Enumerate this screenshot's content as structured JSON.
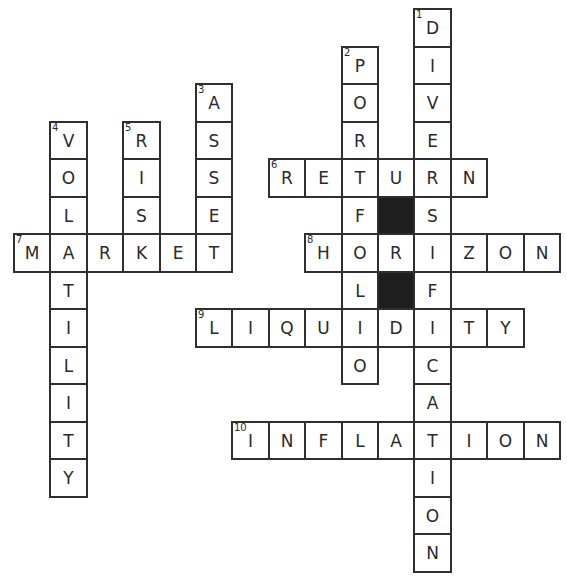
{
  "puzzle": {
    "grid": {
      "origin_x": 13,
      "origin_y": 8,
      "cell_w": 36.4,
      "cell_h": 37.5,
      "cols": 15,
      "rows": 15
    },
    "colors": {
      "border": "#2f2f2f",
      "block": "#1e1e1e",
      "text": "#2a2a2a",
      "background": "#ffffff"
    },
    "words": [
      {
        "number": 1,
        "direction": "down",
        "answer": "DIVERSIFICATION",
        "col": 11,
        "row": 0
      },
      {
        "number": 2,
        "direction": "down",
        "answer": "PORTFOLIO",
        "col": 9,
        "row": 1
      },
      {
        "number": 3,
        "direction": "down",
        "answer": "ASSET",
        "col": 5,
        "row": 2
      },
      {
        "number": 4,
        "direction": "down",
        "answer": "VOLATILITY",
        "col": 1,
        "row": 3
      },
      {
        "number": 5,
        "direction": "down",
        "answer": "RISK",
        "col": 3,
        "row": 3
      },
      {
        "number": 6,
        "direction": "across",
        "answer": "RETURN",
        "col": 7,
        "row": 4
      },
      {
        "number": 7,
        "direction": "across",
        "answer": "MARKET",
        "col": 0,
        "row": 6
      },
      {
        "number": 8,
        "direction": "across",
        "answer": "HORIZON",
        "col": 8,
        "row": 6
      },
      {
        "number": 9,
        "direction": "across",
        "answer": "LIQUIDITY",
        "col": 5,
        "row": 8
      },
      {
        "number": 10,
        "direction": "across",
        "answer": "INFLATION",
        "col": 6,
        "row": 11
      }
    ],
    "blocks": [
      {
        "col": 10,
        "row": 5
      },
      {
        "col": 10,
        "row": 7
      }
    ]
  }
}
